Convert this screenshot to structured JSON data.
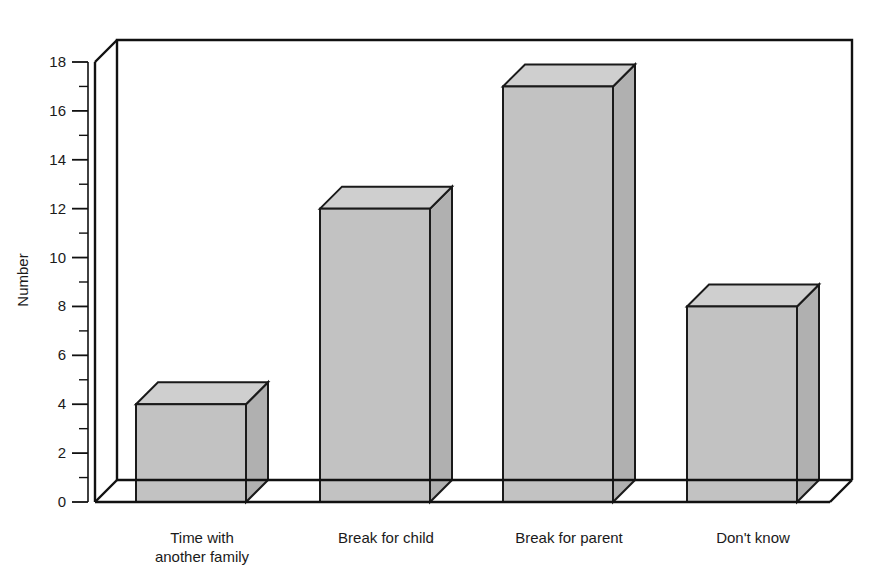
{
  "chart_data": {
    "type": "bar",
    "title": "",
    "subtitle": "",
    "xlabel": "",
    "ylabel": "Number",
    "categories": [
      "Time with another family",
      "Break for child",
      "Break for parent",
      "Don't know"
    ],
    "category_lines": [
      [
        "Time with",
        "another family"
      ],
      [
        "Break for child"
      ],
      [
        "Break for parent"
      ],
      [
        "Don't know"
      ]
    ],
    "values": [
      4,
      12,
      17,
      8
    ],
    "ylim": [
      0,
      18
    ],
    "ytick_step": 2,
    "yticks": [
      0,
      2,
      4,
      6,
      8,
      10,
      12,
      14,
      16,
      18
    ],
    "ytick_labels": [
      "0",
      "2",
      "4",
      "6",
      "8",
      "10",
      "12",
      "14",
      "16",
      "18"
    ],
    "minor_ticks": [
      1,
      3,
      5,
      7,
      9,
      11,
      13,
      15,
      17
    ],
    "grid": true,
    "grid_axis": "y",
    "legend": false,
    "legend_position": "none",
    "style": "3d",
    "colors": {
      "bar_front": "#c2c2c2",
      "bar_top": "#cfcfcf",
      "bar_side": "#b0b0b0",
      "outline": "#1a1a1a",
      "gridline": "#8c8c8c",
      "axis": "#111111",
      "background": "#ffffff"
    }
  }
}
